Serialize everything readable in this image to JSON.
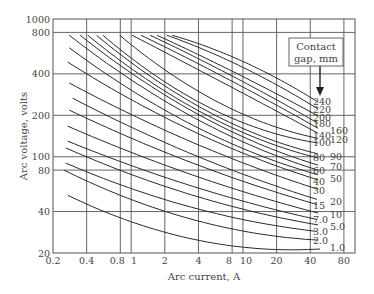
{
  "chart_data": {
    "type": "line",
    "title": "",
    "xlabel": "Arc current, A",
    "ylabel": "Arc voltage, volts",
    "xscale": "log",
    "yscale": "log",
    "xlim": [
      0.2,
      100
    ],
    "ylim": [
      20,
      1000
    ],
    "grid": true,
    "x_ticks": [
      {
        "value": 0.2,
        "label": "0.2"
      },
      {
        "value": 0.4,
        "label": "0.4"
      },
      {
        "value": 0.8,
        "label": "0.8"
      },
      {
        "value": 1,
        "label": "1"
      },
      {
        "value": 2,
        "label": "2"
      },
      {
        "value": 4,
        "label": "4"
      },
      {
        "value": 8,
        "label": "8"
      },
      {
        "value": 10,
        "label": "10"
      },
      {
        "value": 20,
        "label": "20"
      },
      {
        "value": 40,
        "label": "40"
      },
      {
        "value": 80,
        "label": "80"
      }
    ],
    "y_ticks": [
      {
        "value": 20,
        "label": "20"
      },
      {
        "value": 40,
        "label": "40"
      },
      {
        "value": 80,
        "label": "80"
      },
      {
        "value": 100,
        "label": "100"
      },
      {
        "value": 200,
        "label": "200"
      },
      {
        "value": 400,
        "label": "400"
      },
      {
        "value": 800,
        "label": "800"
      },
      {
        "value": 1000,
        "label": "1000"
      }
    ],
    "legend": {
      "title_line1": "Contact",
      "title_line2": "gap, mm",
      "placement": "top-right"
    },
    "series": [
      {
        "name": "1.0",
        "label": "1.0",
        "label_col": 2,
        "points": [
          [
            0.27,
            52.6
          ],
          [
            2,
            28.3
          ],
          [
            49,
            21.4
          ]
        ],
        "label_v": 21.8
      },
      {
        "name": "2.0",
        "label": "2.0",
        "label_col": 1,
        "points": [
          [
            0.25,
            80
          ],
          [
            2,
            40.2
          ],
          [
            47,
            24.8
          ]
        ],
        "label_v": 24.8
      },
      {
        "name": "3.0",
        "label": "3.0",
        "label_col": 1,
        "points": [
          [
            0.26,
            90
          ],
          [
            2,
            48.9
          ],
          [
            46,
            28.7
          ]
        ],
        "label_v": 28.7
      },
      {
        "name": "5.0",
        "label": "5.0",
        "label_col": 2,
        "points": [
          [
            0.26,
            116
          ],
          [
            2,
            61
          ],
          [
            47,
            32
          ]
        ],
        "label_v": 31
      },
      {
        "name": "7.0",
        "label": "7.0",
        "label_col": 1,
        "points": [
          [
            0.27,
            130
          ],
          [
            2,
            71
          ],
          [
            46,
            35
          ]
        ],
        "label_v": 35
      },
      {
        "name": "10",
        "label": "10",
        "label_col": 2,
        "points": [
          [
            0.27,
            167
          ],
          [
            2,
            87
          ],
          [
            47,
            39
          ]
        ],
        "label_v": 38
      },
      {
        "name": "15",
        "label": "15",
        "label_col": 1,
        "points": [
          [
            0.28,
            218
          ],
          [
            2,
            108
          ],
          [
            46,
            45
          ]
        ],
        "label_v": 44
      },
      {
        "name": "20",
        "label": "20",
        "label_col": 2,
        "points": [
          [
            0.3,
            266
          ],
          [
            2,
            127
          ],
          [
            46,
            49
          ]
        ],
        "label_v": 47
      },
      {
        "name": "30",
        "label": "30",
        "label_col": 1,
        "points": [
          [
            0.28,
            343
          ],
          [
            2,
            156
          ],
          [
            47,
            58
          ]
        ],
        "label_v": 57
      },
      {
        "name": "40",
        "label": "40",
        "label_col": 1,
        "points": [
          [
            0.27,
            488
          ],
          [
            2,
            193
          ],
          [
            47,
            68
          ]
        ],
        "label_v": 66
      },
      {
        "name": "50",
        "label": "50",
        "label_col": 2,
        "points": [
          [
            0.28,
            618
          ],
          [
            2,
            218
          ],
          [
            47,
            74
          ]
        ],
        "label_v": 70
      },
      {
        "name": "60",
        "label": "60",
        "label_col": 1,
        "points": [
          [
            0.28,
            762
          ],
          [
            2,
            254
          ],
          [
            47,
            80
          ]
        ],
        "label_v": 79
      },
      {
        "name": "70",
        "label": "70",
        "label_col": 2,
        "points": [
          [
            0.35,
            762
          ],
          [
            2,
            281
          ],
          [
            47,
            87
          ]
        ],
        "label_v": 85
      },
      {
        "name": "80",
        "label": "80",
        "label_col": 1,
        "points": [
          [
            0.41,
            762
          ],
          [
            2,
            300
          ],
          [
            47,
            98
          ]
        ],
        "label_v": 99
      },
      {
        "name": "90",
        "label": "90",
        "label_col": 2,
        "points": [
          [
            0.49,
            762
          ],
          [
            2,
            327
          ],
          [
            47,
            105
          ]
        ],
        "label_v": 101
      },
      {
        "name": "100",
        "label": "100",
        "label_col": 1,
        "points": [
          [
            0.56,
            762
          ],
          [
            2,
            350
          ],
          [
            47,
            126
          ]
        ],
        "label_v": 126
      },
      {
        "name": "120",
        "label": "120",
        "label_col": 2,
        "points": [
          [
            0.79,
            762
          ],
          [
            2,
            428
          ],
          [
            47,
            136
          ]
        ],
        "label_v": 133
      },
      {
        "name": "140",
        "label": "140",
        "label_col": 1,
        "points": [
          [
            1.02,
            762
          ],
          [
            4,
            428
          ],
          [
            47,
            148
          ]
        ],
        "label_v": 142
      },
      {
        "name": "160",
        "label": "160",
        "label_col": 2,
        "points": [
          [
            1.23,
            762
          ],
          [
            4,
            473
          ],
          [
            47,
            161
          ]
        ],
        "label_v": 155
      },
      {
        "name": "180",
        "label": "180",
        "label_col": 1,
        "points": [
          [
            1.48,
            762
          ],
          [
            4,
            515
          ],
          [
            47,
            175
          ]
        ],
        "label_v": 174
      },
      {
        "name": "200",
        "label": "200",
        "label_col": 1,
        "points": [
          [
            1.71,
            762
          ],
          [
            4,
            551
          ],
          [
            47,
            198
          ]
        ],
        "label_v": 194
      },
      {
        "name": "220",
        "label": "220",
        "label_col": 1,
        "points": [
          [
            2.09,
            762
          ],
          [
            6,
            541
          ],
          [
            47,
            222
          ]
        ],
        "label_v": 222
      },
      {
        "name": "240",
        "label": "240",
        "label_col": 1,
        "points": [
          [
            2.33,
            762
          ],
          [
            6,
            587
          ],
          [
            47,
            249
          ]
        ],
        "label_v": 252
      }
    ]
  }
}
